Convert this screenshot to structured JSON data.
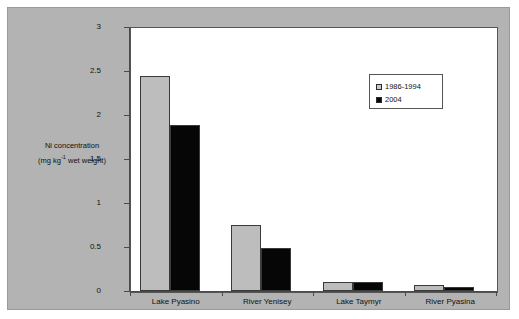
{
  "chart_data": {
    "type": "bar",
    "title": "",
    "xlabel": "",
    "ylabel": "Ni concentration (mg kg-1 wet weight)",
    "ylabel_line1": "Ni concentration",
    "ylabel_line2_prefix": "(mg kg",
    "ylabel_line2_sup": "-1",
    "ylabel_line2_suffix": " wet weight)",
    "categories": [
      "Lake Pyasino",
      "River Yenisey",
      "Lake Taymyr",
      "River Pyasina"
    ],
    "series": [
      {
        "name": "1986-1994",
        "color": "#bdbdbd",
        "values": [
          2.44,
          0.75,
          0.1,
          0.07
        ]
      },
      {
        "name": "2004",
        "color": "#060606",
        "values": [
          1.89,
          0.49,
          0.1,
          0.045
        ]
      }
    ],
    "ylim": [
      0,
      3
    ],
    "yticks": [
      0,
      0.5,
      1,
      1.5,
      2,
      2.5,
      3
    ],
    "ytick_labels": [
      "0",
      "0.5",
      "1",
      "1.5",
      "2",
      "2.5",
      "3"
    ],
    "grid": false,
    "legend_position": "upper right"
  },
  "colors": {
    "figure_background": "#b3b3b3",
    "plot_background": "#ffffff",
    "axis": "#4a4a4a",
    "series_1986_1994": "#bdbdbd",
    "series_2004": "#060606",
    "text": "#111111"
  }
}
